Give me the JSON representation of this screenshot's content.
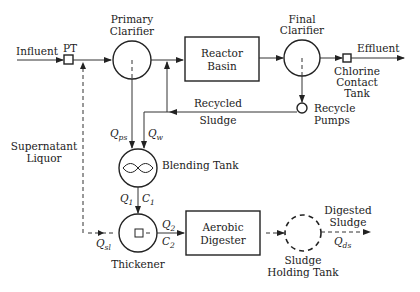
{
  "diagram": {
    "type": "wastewater treatment process flow",
    "nodes": {
      "influent": {
        "label": "Influent"
      },
      "pt": {
        "label": "PT"
      },
      "primary_clarifier": {
        "label_line1": "Primary",
        "label_line2": "Clarifier"
      },
      "reactor_basin": {
        "label_line1": "Reactor",
        "label_line2": "Basin"
      },
      "final_clarifier": {
        "label_line1": "Final",
        "label_line2": "Clarifier"
      },
      "chlorine_contact_tank": {
        "label_line1": "Chlorine",
        "label_line2": "Contact",
        "label_line3": "Tank"
      },
      "effluent": {
        "label": "Effluent"
      },
      "recycle_pumps": {
        "label_line1": "Recycle",
        "label_line2": "Pumps"
      },
      "recycled_sludge": {
        "label_line1": "Recycled",
        "label_line2": "Sludge"
      },
      "blending_tank": {
        "label": "Blending Tank"
      },
      "thickener": {
        "label": "Thickener"
      },
      "aerobic_digester": {
        "label_line1": "Aerobic",
        "label_line2": "Digester"
      },
      "sludge_holding_tank": {
        "label_line1": "Sludge",
        "label_line2": "Holding Tank"
      },
      "digested_sludge": {
        "label_line1": "Digested",
        "label_line2": "Sludge"
      },
      "supernatant_liquor": {
        "label_line1": "Supernatant",
        "label_line2": "Liquor"
      }
    },
    "flows": {
      "q_ps": {
        "main": "Q",
        "sub": "ps"
      },
      "q_w": {
        "main": "Q",
        "sub": "w"
      },
      "q_1": {
        "main": "Q",
        "sub": "1"
      },
      "c_1": {
        "main": "C",
        "sub": "1"
      },
      "q_2": {
        "main": "Q",
        "sub": "2"
      },
      "c_2": {
        "main": "C",
        "sub": "2"
      },
      "q_sl": {
        "main": "Q",
        "sub": "sl"
      },
      "q_ds": {
        "main": "Q",
        "sub": "ds"
      }
    },
    "edges": [
      {
        "from": "Influent",
        "to": "PT",
        "style": "solid"
      },
      {
        "from": "PT",
        "to": "Primary Clarifier",
        "style": "solid"
      },
      {
        "from": "Primary Clarifier",
        "to": "Reactor Basin",
        "style": "solid"
      },
      {
        "from": "Reactor Basin",
        "to": "Final Clarifier",
        "style": "solid"
      },
      {
        "from": "Final Clarifier",
        "to": "Chlorine Contact Tank",
        "style": "solid"
      },
      {
        "from": "Chlorine Contact Tank",
        "to": "Effluent",
        "style": "solid"
      },
      {
        "from": "Final Clarifier",
        "to": "Recycle Pumps",
        "style": "solid"
      },
      {
        "from": "Recycle Pumps",
        "to": "Reactor Basin inlet",
        "label": "Recycled Sludge",
        "style": "solid"
      },
      {
        "from": "Primary Clarifier",
        "to": "Blending Tank",
        "label": "Q_ps",
        "style": "solid"
      },
      {
        "from": "Recycled Sludge line",
        "to": "Blending Tank",
        "label": "Q_w",
        "style": "solid"
      },
      {
        "from": "Blending Tank",
        "to": "Thickener",
        "label": "Q_1 C_1",
        "style": "solid"
      },
      {
        "from": "Thickener",
        "to": "Aerobic Digester",
        "label": "Q_2 C_2",
        "style": "solid"
      },
      {
        "from": "Thickener",
        "to": "PT outlet",
        "label": "Q_sl / Supernatant Liquor",
        "style": "dashed"
      },
      {
        "from": "Aerobic Digester",
        "to": "Sludge Holding Tank",
        "style": "dashed"
      },
      {
        "from": "Sludge Holding Tank",
        "to": "Digested Sludge",
        "label": "Q_ds",
        "style": "dashed"
      }
    ]
  }
}
